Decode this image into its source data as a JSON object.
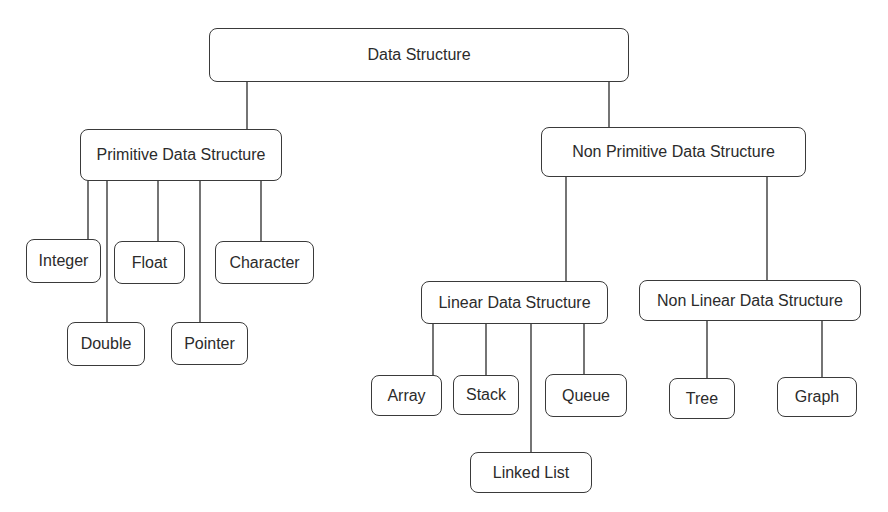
{
  "diagram": {
    "title": "Data Structure",
    "nodes": {
      "root": {
        "label": "Data Structure"
      },
      "primitive": {
        "label": "Primitive Data Structure"
      },
      "non_primitive": {
        "label": "Non Primitive Data Structure"
      },
      "integer": {
        "label": "Integer"
      },
      "float": {
        "label": "Float"
      },
      "character": {
        "label": "Character"
      },
      "double": {
        "label": "Double"
      },
      "pointer": {
        "label": "Pointer"
      },
      "linear": {
        "label": "Linear Data Structure"
      },
      "non_linear": {
        "label": "Non Linear Data Structure"
      },
      "array": {
        "label": "Array"
      },
      "stack": {
        "label": "Stack"
      },
      "queue": {
        "label": "Queue"
      },
      "linked_list": {
        "label": "Linked List"
      },
      "tree": {
        "label": "Tree"
      },
      "graph": {
        "label": "Graph"
      }
    },
    "edges": [
      [
        "root",
        "primitive"
      ],
      [
        "root",
        "non_primitive"
      ],
      [
        "primitive",
        "integer"
      ],
      [
        "primitive",
        "double"
      ],
      [
        "primitive",
        "float"
      ],
      [
        "primitive",
        "pointer"
      ],
      [
        "primitive",
        "character"
      ],
      [
        "non_primitive",
        "linear"
      ],
      [
        "non_primitive",
        "non_linear"
      ],
      [
        "linear",
        "array"
      ],
      [
        "linear",
        "stack"
      ],
      [
        "linear",
        "linked_list"
      ],
      [
        "linear",
        "queue"
      ],
      [
        "non_linear",
        "tree"
      ],
      [
        "non_linear",
        "graph"
      ]
    ]
  }
}
